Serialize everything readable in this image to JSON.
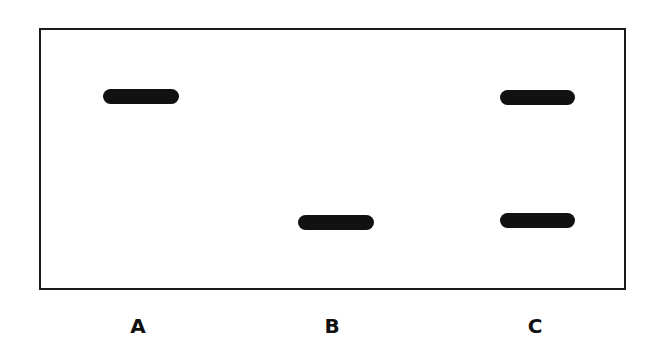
{
  "diagram": {
    "type": "gel-electrophoresis",
    "lanes": [
      {
        "label": "A",
        "bands": [
          {
            "position": "upper"
          }
        ]
      },
      {
        "label": "B",
        "bands": [
          {
            "position": "lower"
          }
        ]
      },
      {
        "label": "C",
        "bands": [
          {
            "position": "upper"
          },
          {
            "position": "lower"
          }
        ]
      }
    ],
    "colors": {
      "band": "#111111",
      "border": "#1a1a1a",
      "background": "#ffffff"
    }
  }
}
